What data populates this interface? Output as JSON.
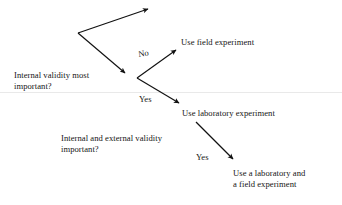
{
  "diagram": {
    "background_color": "#ffffff",
    "ink_color": "#151515",
    "nodes": [
      {
        "id": "q1",
        "line1": "Internal validity most",
        "line2": "important?",
        "x": 14,
        "y": 70
      },
      {
        "id": "field",
        "line1": "Use field experiment",
        "line2": "",
        "x": 181,
        "y": 37
      },
      {
        "id": "lab",
        "line1": "Use laboratory experiment",
        "line2": "",
        "x": 182,
        "y": 108
      },
      {
        "id": "q2",
        "line1": "Internal and external validity",
        "line2": "important?",
        "x": 61,
        "y": 133
      },
      {
        "id": "labfield",
        "line1": "Use a laboratory and",
        "line2": "a field experiment",
        "x": 233,
        "y": 168
      }
    ],
    "branch_labels": [
      {
        "id": "no-branch",
        "text": "No",
        "x": 139,
        "y": 49
      },
      {
        "id": "yes-lab-branch",
        "text": "Yes",
        "x": 139,
        "y": 94
      },
      {
        "id": "yes-labfield-branch",
        "text": "Yes",
        "x": 196,
        "y": 152
      }
    ],
    "arrows": [
      {
        "id": "arrow-up-top",
        "x1": 78,
        "y1": 33,
        "x2": 148,
        "y2": 9
      },
      {
        "id": "arrow-down-to-node1",
        "x1": 78,
        "y1": 33,
        "x2": 125,
        "y2": 73
      },
      {
        "id": "arrow-no-to-field",
        "x1": 137,
        "y1": 78,
        "x2": 176,
        "y2": 50
      },
      {
        "id": "arrow-yes-to-lab",
        "x1": 137,
        "y1": 78,
        "x2": 179,
        "y2": 103
      },
      {
        "id": "arrow-yes-to-labfield",
        "x1": 196,
        "y1": 122,
        "x2": 233,
        "y2": 159
      }
    ]
  }
}
